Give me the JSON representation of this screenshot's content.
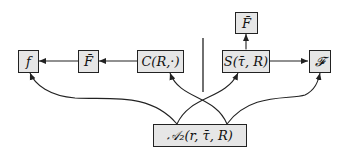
{
  "diagram": {
    "nodes": {
      "f": {
        "label": "f"
      },
      "F_bar_left": {
        "label": "F̄"
      },
      "C": {
        "label": "C(R,·)"
      },
      "F_bar_top": {
        "label": "F̄"
      },
      "S": {
        "label": "S(τ̄, R)"
      },
      "F_cal": {
        "label": "𝓕"
      },
      "A2": {
        "label": "𝒜₂(r, τ̄, R)"
      }
    },
    "edges": [
      {
        "from": "C",
        "to": "F_bar_left",
        "type": "arrow"
      },
      {
        "from": "F_bar_left",
        "to": "f",
        "type": "arrow"
      },
      {
        "from": "S",
        "to": "F_cal",
        "type": "arrow"
      },
      {
        "from": "S",
        "to": "F_bar_top",
        "type": "bidirectional"
      },
      {
        "from": "A2",
        "to": "f",
        "type": "curved-arrow"
      },
      {
        "from": "A2",
        "to": "C",
        "type": "curved-arrow"
      },
      {
        "from": "A2",
        "to": "S",
        "type": "curved-arrow"
      },
      {
        "from": "A2",
        "to": "F_cal",
        "type": "curved-arrow"
      }
    ],
    "separator": "vertical-line"
  }
}
